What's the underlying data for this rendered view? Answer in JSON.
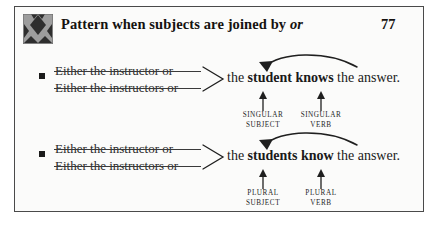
{
  "header": {
    "icon": "argyle-diamond-icon",
    "title_prefix": "Pattern when subjects are joined by ",
    "title_emphasis": "or",
    "page_number": "77"
  },
  "examples": [
    {
      "bullet": "square-bullet",
      "subjects": [
        "Either the instructor or",
        "Either the instructors or"
      ],
      "brace": "angle-brace",
      "predicate": {
        "lead": "the ",
        "subject_word": "student",
        "middle": " ",
        "verb_word": "knows",
        "tail": " the answer."
      },
      "curve_arrow": "verb-to-subject-agreement-arrow",
      "captions": [
        {
          "line1": "SINGULAR",
          "line2": "SUBJECT"
        },
        {
          "line1": "SINGULAR",
          "line2": "VERB"
        }
      ]
    },
    {
      "bullet": "square-bullet",
      "subjects": [
        "Either the instructor or",
        "Either the instructors or"
      ],
      "brace": "angle-brace",
      "predicate": {
        "lead": "the ",
        "subject_word": "students",
        "middle": " ",
        "verb_word": "know",
        "tail": " the answer."
      },
      "curve_arrow": "verb-to-subject-agreement-arrow",
      "captions": [
        {
          "line1": "PLURAL",
          "line2": "SUBJECT"
        },
        {
          "line1": "PLURAL",
          "line2": "VERB"
        }
      ]
    }
  ],
  "colors": {
    "ink": "#1a1a1a",
    "rule": "#4a4a4a",
    "page": "#fbfbfa",
    "icon_light": "#9a9a9a",
    "icon_dark": "#3a3a3a"
  }
}
